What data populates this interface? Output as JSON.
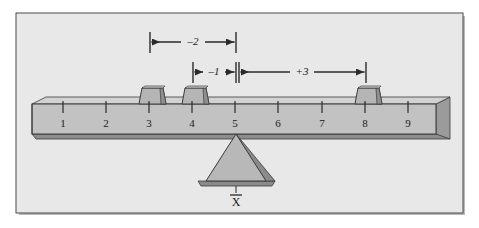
{
  "figure": {
    "background_color": "#ffffff",
    "panel_color": "#e8e8e8",
    "panel_border_color": "#4a4a4a",
    "beam_face_color": "#c2c2c2",
    "beam_edge_color": "#3a3a3a",
    "beam_shadow_color": "#8d8d8d",
    "block_face_color": "#b5b5b5",
    "block_side_color": "#8f8f8f",
    "fulcrum_face_color": "#b8b8b8",
    "fulcrum_side_color": "#8a8a8a",
    "line_color": "#2b2b2b"
  },
  "scale": {
    "label": "number-line-scale",
    "ticks": [
      {
        "value": "1",
        "x": 63
      },
      {
        "value": "2",
        "x": 106
      },
      {
        "value": "3",
        "x": 149
      },
      {
        "value": "4",
        "x": 192
      },
      {
        "value": "5",
        "x": 235
      },
      {
        "value": "6",
        "x": 278
      },
      {
        "value": "7",
        "x": 322
      },
      {
        "value": "8",
        "x": 365
      },
      {
        "value": "9",
        "x": 408
      }
    ]
  },
  "blocks": [
    {
      "name": "block-at-3",
      "at": "3",
      "x": 149
    },
    {
      "name": "block-at-4",
      "at": "4",
      "x": 192
    },
    {
      "name": "block-at-8",
      "at": "8",
      "x": 365
    }
  ],
  "dimensions": [
    {
      "name": "deviation-minus-2",
      "label": "–2",
      "from": "3",
      "to": "5",
      "x1": 150,
      "x2": 236,
      "y": 42,
      "label_x": 193,
      "label_y": 39
    },
    {
      "name": "deviation-minus-1",
      "label": "–1",
      "from": "4",
      "to": "5",
      "x1": 193,
      "x2": 236,
      "y": 72,
      "label_x": 214,
      "label_y": 69
    },
    {
      "name": "deviation-plus-3",
      "label": "+3",
      "from": "5",
      "to": "8",
      "x1": 238,
      "x2": 366,
      "y": 72,
      "label_x": 302,
      "label_y": 69
    }
  ],
  "fulcrum": {
    "name": "fulcrum-triangle",
    "at": "5",
    "apex_x": 236,
    "mean_symbol": "X",
    "mean_symbol_label": "X-bar (sample mean)",
    "mean_label_x": 236,
    "mean_label_y": 203
  }
}
